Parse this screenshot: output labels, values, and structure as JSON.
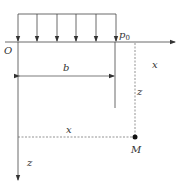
{
  "diagram": {
    "type": "strip-load-coordinate-diagram",
    "labels": {
      "origin": "O",
      "load": "p",
      "load_sub": "0",
      "width": "b",
      "x_axis": "x",
      "z_axis": "z",
      "x_distance": "x",
      "z_distance": "z",
      "point": "M"
    },
    "load_arrows_count": 6,
    "colors": {
      "line": "#444444",
      "dashed": "#666666",
      "point": "#111111"
    }
  }
}
